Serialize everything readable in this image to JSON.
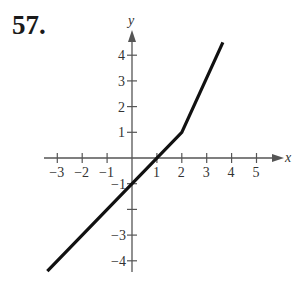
{
  "problem": {
    "number": "57."
  },
  "chart_data": {
    "type": "line",
    "title": "",
    "xlabel": "x",
    "ylabel": "y",
    "xlim": [
      -3.4,
      6
    ],
    "ylim": [
      -4.5,
      5
    ],
    "grid": false,
    "x_ticks": [
      -3,
      -2,
      -1,
      1,
      2,
      3,
      4,
      5
    ],
    "y_ticks": [
      4,
      3,
      2,
      1,
      -1,
      -3,
      -4
    ],
    "x_tick_labels": [
      "−3",
      "−2",
      "−1",
      "1",
      "2",
      "3",
      "4",
      "5"
    ],
    "y_tick_labels": [
      "4",
      "3",
      "2",
      "1",
      "−1",
      "−3",
      "−4"
    ],
    "series": [
      {
        "name": "piecewise linear function",
        "x": [
          -3.4,
          2,
          3.65
        ],
        "y": [
          -4.4,
          1,
          4.5
        ],
        "color": "#111111"
      }
    ]
  }
}
